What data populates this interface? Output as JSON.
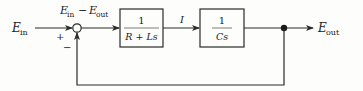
{
  "diagram": {
    "type": "block-diagram",
    "input": {
      "symbol": "E",
      "subscript": "in"
    },
    "output": {
      "symbol": "E",
      "subscript": "out"
    },
    "error_label": {
      "left_symbol": "E",
      "left_sub": "in",
      "op": "−",
      "right_symbol": "E",
      "right_sub": "out"
    },
    "summing_junction": {
      "plus_sign": "+",
      "minus_sign": "−"
    },
    "blocks": [
      {
        "numerator": "1",
        "denominator": "R + Ls"
      },
      {
        "numerator": "1",
        "denominator": "Cs"
      }
    ],
    "intermediate_signal": "I",
    "feedback": "unity negative feedback",
    "colors": {
      "line": "#2a2a2a",
      "background": "#fdfdfb"
    }
  }
}
